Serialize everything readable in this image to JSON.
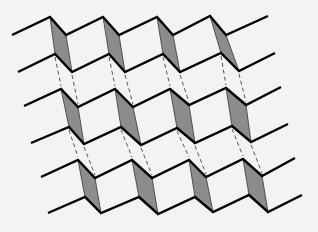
{
  "diagram": {
    "colors": {
      "background": "#f3f3f3",
      "edge": "#000000",
      "fold_face": "#8c8c8c",
      "dash": "#555555"
    },
    "layers": [
      {
        "name": "layer-1",
        "upper": [
          [
            12,
            35
          ],
          [
            50,
            17
          ],
          [
            66,
            35
          ],
          [
            103,
            17
          ],
          [
            119,
            35
          ],
          [
            157,
            17
          ],
          [
            173,
            35
          ],
          [
            210,
            16
          ],
          [
            226,
            35
          ],
          [
            268,
            16
          ]
        ],
        "lower": [
          [
            18,
            72
          ],
          [
            55,
            54
          ],
          [
            72,
            72
          ],
          [
            109,
            54
          ],
          [
            125,
            72
          ],
          [
            163,
            54
          ],
          [
            180,
            72
          ],
          [
            221,
            53
          ],
          [
            239,
            71
          ],
          [
            275,
            53
          ]
        ]
      },
      {
        "name": "layer-2",
        "upper": [
          [
            24,
            106
          ],
          [
            61,
            89
          ],
          [
            78,
            107
          ],
          [
            115,
            89
          ],
          [
            133,
            107
          ],
          [
            170,
            89
          ],
          [
            189,
            105
          ],
          [
            226,
            88
          ],
          [
            246,
            105
          ],
          [
            281,
            87
          ]
        ],
        "lower": [
          [
            31,
            143
          ],
          [
            69,
            127
          ],
          [
            84,
            144
          ],
          [
            121,
            127
          ],
          [
            141,
            145
          ],
          [
            177,
            128
          ],
          [
            195,
            143
          ],
          [
            232,
            126
          ],
          [
            251,
            142
          ],
          [
            288,
            124
          ]
        ]
      },
      {
        "name": "layer-3",
        "upper": [
          [
            41,
            177
          ],
          [
            78,
            160
          ],
          [
            95,
            178
          ],
          [
            132,
            160
          ],
          [
            152,
            178
          ],
          [
            189,
            160
          ],
          [
            206,
            177
          ],
          [
            243,
            159
          ],
          [
            262,
            176
          ],
          [
            295,
            158
          ]
        ],
        "lower": [
          [
            48,
            213
          ],
          [
            85,
            197
          ],
          [
            101,
            213
          ],
          [
            139,
            197
          ],
          [
            158,
            214
          ],
          [
            195,
            197
          ],
          [
            213,
            212
          ],
          [
            249,
            195
          ],
          [
            268,
            212
          ],
          [
            302,
            195
          ]
        ]
      }
    ]
  }
}
